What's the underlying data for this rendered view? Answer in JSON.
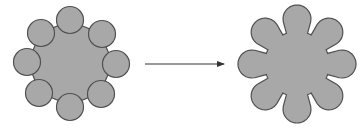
{
  "diagram": {
    "colors": {
      "fill": "#a8a8a8",
      "stroke": "#505050",
      "arrow": "#333333",
      "background": "#ffffff"
    },
    "left_figure": {
      "label": "",
      "center": [
        70,
        63
      ],
      "polygon_radius": 42,
      "circle_count": 8,
      "circle_radius": 13.5,
      "circles": [
        {
          "cx": 70,
          "cy": 20
        },
        {
          "cx": 102,
          "cy": 34
        },
        {
          "cx": 116,
          "cy": 64
        },
        {
          "cx": 101,
          "cy": 94
        },
        {
          "cx": 70,
          "cy": 107
        },
        {
          "cx": 39,
          "cy": 93
        },
        {
          "cx": 27,
          "cy": 62
        },
        {
          "cx": 41,
          "cy": 33
        }
      ]
    },
    "arrow": {
      "x1": 145,
      "y1": 64,
      "x2": 224,
      "y2": 64,
      "direction": "right"
    },
    "right_figure": {
      "label": "",
      "center": [
        297,
        64
      ],
      "lobe_count": 8,
      "lobe_distance": 45,
      "lobe_radius": 14
    }
  }
}
